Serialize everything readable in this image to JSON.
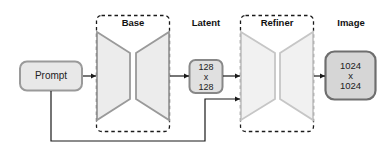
{
  "diagram": {
    "nodes": {
      "prompt": {
        "label": "Prompt"
      },
      "base": {
        "label": "Base"
      },
      "latent": {
        "label": "Latent",
        "line1": "128",
        "line2": "x",
        "line3": "128"
      },
      "refiner": {
        "label": "Refiner"
      },
      "image": {
        "label": "Image",
        "line1": "1024",
        "line2": "x",
        "line3": "1024"
      }
    },
    "edges": [
      {
        "from": "prompt",
        "to": "base"
      },
      {
        "from": "base",
        "to": "latent"
      },
      {
        "from": "latent",
        "to": "refiner"
      },
      {
        "from": "prompt",
        "to": "refiner"
      },
      {
        "from": "refiner",
        "to": "image"
      }
    ],
    "colors": {
      "box_fill": "#e3e3e3",
      "box_stroke": "#8c8c8c",
      "image_fill": "#d6d6d6",
      "image_stroke": "#6e6e6e",
      "base_trap_fill": "#ececec",
      "base_trap_stroke": "#9a9a9a",
      "refiner_trap_fill": "#f0f0f0",
      "refiner_trap_stroke": "#c4c4c4",
      "arrow": "#1a1a1a"
    }
  }
}
